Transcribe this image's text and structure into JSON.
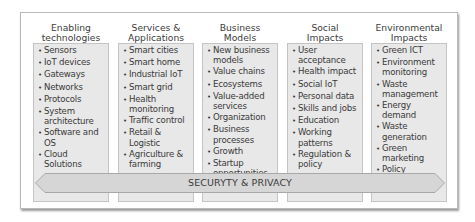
{
  "diagram": {
    "columns": [
      {
        "title_line1": "Enabling",
        "title_line2": "technologies",
        "items": [
          "Sensors",
          "IoT devices",
          "Gateways",
          "Networks",
          "Protocols",
          "System architecture",
          "Software and OS",
          "Cloud Solutions"
        ]
      },
      {
        "title_line1": "Services &",
        "title_line2": "Applications",
        "items": [
          "Smart cities",
          "Smart home",
          "Industrial IoT",
          "Smart grid",
          "Health monitoring",
          "Traffic control",
          "Retail & Logistic",
          "Agriculture & farming"
        ]
      },
      {
        "title_line1": "Business",
        "title_line2": "Models",
        "items": [
          "New business models",
          "Value chains",
          "Ecosystems",
          "Value-added services",
          "Organization",
          "Business processes",
          "Growth",
          "Startup opportunities"
        ]
      },
      {
        "title_line1": "Social",
        "title_line2": "Impacts",
        "items": [
          "User acceptance",
          "Health impact",
          "Social IoT",
          "Personal data",
          "Skills and jobs",
          "Education",
          "Working patterns",
          "Regulation & policy"
        ]
      },
      {
        "title_line1": "Environmental",
        "title_line2": "Impacts",
        "items": [
          "Green ICT",
          "Environment monitoring",
          "Waste management",
          "Energy demand",
          "Waste generation",
          "Green marketing",
          "Policy"
        ]
      }
    ],
    "band_label": "SECURYTY & PRIVACY",
    "bullet": "•",
    "colors": {
      "box_fill": "#e8e8e8",
      "band_fill": "#d6d6d6",
      "border": "#b8b8b8",
      "text": "#3a3a3a"
    }
  }
}
